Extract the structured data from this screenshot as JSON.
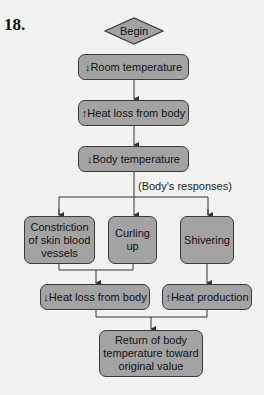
{
  "question_number": "18.",
  "flowchart": {
    "start": "Begin",
    "steps": [
      "↓Room temperature",
      "↑Heat loss from body",
      "↓Body temperature"
    ],
    "branch_label": "(Body's responses)",
    "responses": [
      "Constriction of skin blood vessels",
      "Curling up",
      "Shivering"
    ],
    "effects": [
      "↓Heat loss from body",
      "↑Heat production"
    ],
    "outcome": "Return of body temperature toward original value"
  },
  "colors": {
    "box_fill": "#a3a3a3",
    "box_border": "#3a3a3a",
    "background": "#f2f2f0",
    "line": "#333333"
  }
}
